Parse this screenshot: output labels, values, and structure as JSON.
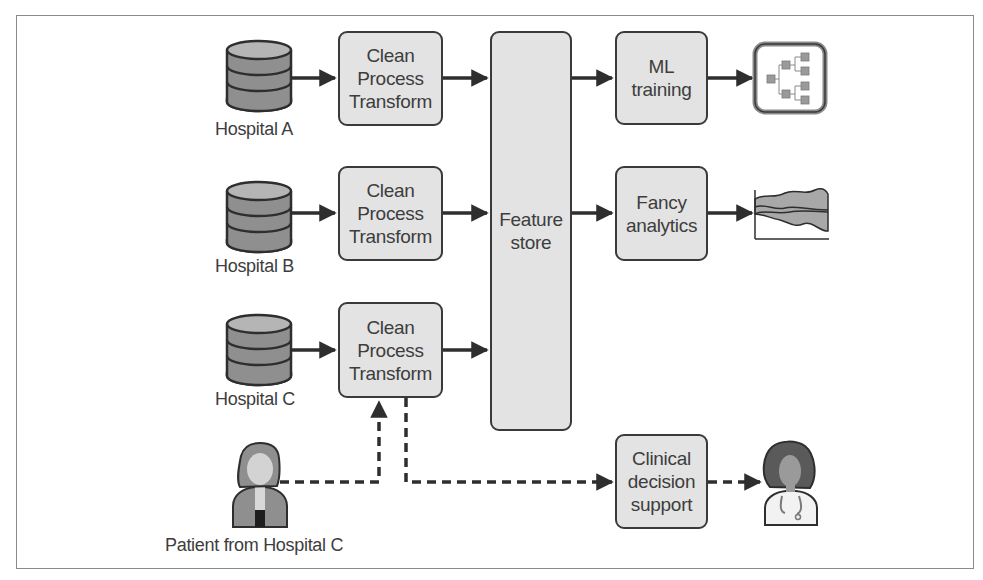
{
  "diagram": {
    "sources": [
      {
        "id": "hospital-a",
        "label": "Hospital A",
        "icon": "database-icon"
      },
      {
        "id": "hospital-b",
        "label": "Hospital B",
        "icon": "database-icon"
      },
      {
        "id": "hospital-c",
        "label": "Hospital C",
        "icon": "database-icon"
      }
    ],
    "processing": [
      {
        "id": "clean-a",
        "label": "Clean\nProcess\nTransform"
      },
      {
        "id": "clean-b",
        "label": "Clean\nProcess\nTransform"
      },
      {
        "id": "clean-c",
        "label": "Clean\nProcess\nTransform"
      }
    ],
    "feature_store": {
      "label": "Feature\nstore"
    },
    "consumers": [
      {
        "id": "ml-training",
        "label": "ML\ntraining",
        "output_icon": "decision-tree-icon"
      },
      {
        "id": "fancy-analytics",
        "label": "Fancy\nanalytics",
        "output_icon": "area-chart-icon"
      },
      {
        "id": "clinical-decision-support",
        "label": "Clinical\ndecision\nsupport",
        "output_icon": "doctor-icon"
      }
    ],
    "patient": {
      "label": "Patient from Hospital C",
      "icon": "patient-icon"
    },
    "edges": [
      {
        "from": "hospital-a",
        "to": "clean-a",
        "style": "solid"
      },
      {
        "from": "hospital-b",
        "to": "clean-b",
        "style": "solid"
      },
      {
        "from": "hospital-c",
        "to": "clean-c",
        "style": "solid"
      },
      {
        "from": "clean-a",
        "to": "feature-store",
        "style": "solid"
      },
      {
        "from": "clean-b",
        "to": "feature-store",
        "style": "solid"
      },
      {
        "from": "clean-c",
        "to": "feature-store",
        "style": "solid"
      },
      {
        "from": "feature-store",
        "to": "ml-training",
        "style": "solid"
      },
      {
        "from": "feature-store",
        "to": "fancy-analytics",
        "style": "solid"
      },
      {
        "from": "ml-training",
        "to": "decision-tree",
        "style": "solid"
      },
      {
        "from": "fancy-analytics",
        "to": "area-chart",
        "style": "solid"
      },
      {
        "from": "patient",
        "to": "clean-c",
        "style": "dashed"
      },
      {
        "from": "clean-c",
        "to": "clinical-decision-support",
        "style": "dashed"
      },
      {
        "from": "clinical-decision-support",
        "to": "doctor",
        "style": "dashed"
      }
    ],
    "colors": {
      "box_fill": "#e3e3e3",
      "stroke": "#3a3a3a",
      "db_top": "#b5b5b5",
      "db_body": "#8f8f8f",
      "frame": "#8a8a8a"
    }
  }
}
